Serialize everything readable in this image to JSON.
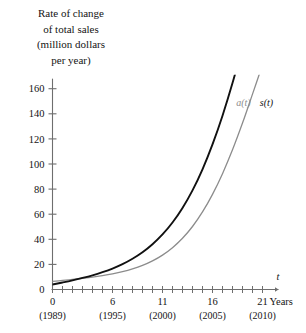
{
  "chart_data": {
    "type": "line",
    "title": "Rate of change of total sales (million dollars per year)",
    "title_lines": [
      "Rate of change",
      "of total sales",
      "(million dollars",
      "per year)"
    ],
    "xlabel_symbol": "t",
    "xlabel_unit": "Years",
    "ylabel": "Rate of change of total sales (million dollars per year)",
    "xlim": [
      0,
      22
    ],
    "ylim": [
      0,
      168
    ],
    "grid": false,
    "legend_position": "inline-at-curve-ends",
    "x_ticks_major": [
      0,
      6,
      11,
      16,
      21
    ],
    "x_tick_labels": [
      "0",
      "6",
      "11",
      "16",
      "21"
    ],
    "x_tick_sublabels": [
      "(1989)",
      "(1995)",
      "(2000)",
      "(2005)",
      "(2010)"
    ],
    "x_ticks_minor_step": 1,
    "y_ticks": [
      0,
      20,
      40,
      60,
      80,
      100,
      120,
      140,
      160
    ],
    "y_tick_labels": [
      "0",
      "20",
      "40",
      "60",
      "80",
      "100",
      "120",
      "140",
      "160"
    ],
    "series": [
      {
        "name": "a(t)",
        "label": "a(t)",
        "color": "#8c8c8c",
        "width": 1.3,
        "x": [
          0,
          1,
          2,
          3,
          4,
          5,
          6,
          7,
          8,
          9,
          10,
          11,
          12,
          13,
          14,
          15,
          16,
          17,
          18,
          19,
          20,
          21
        ],
        "values": [
          6.5,
          7.2,
          8.0,
          8.9,
          9.9,
          11.1,
          12.5,
          14.2,
          16.4,
          19.2,
          22.8,
          27.4,
          33.3,
          40.8,
          50.2,
          61.8,
          75.8,
          92.3,
          111.3,
          132.6,
          155.7,
          179.0
        ]
      },
      {
        "name": "s(t)",
        "label": "s(t)",
        "color": "#111111",
        "width": 1.9,
        "x": [
          0,
          1,
          2,
          3,
          4,
          5,
          6,
          7,
          8,
          9,
          10,
          11,
          12,
          13,
          14,
          15,
          16,
          17,
          18,
          19,
          20,
          21
        ],
        "values": [
          4.0,
          5.6,
          7.3,
          9.2,
          11.3,
          13.8,
          16.7,
          20.2,
          24.5,
          29.7,
          36.1,
          43.9,
          53.4,
          65.0,
          79.0,
          95.8,
          115.6,
          138.5,
          164.5,
          193.3,
          224.0,
          255.0
        ]
      }
    ],
    "curve_labels": [
      {
        "text": "a(t)",
        "color": "#8c8c8c",
        "x": 19.1,
        "y": 146
      },
      {
        "text": "s(t)",
        "color": "#111111",
        "x": 21.4,
        "y": 146
      }
    ],
    "axis_color": "#6e6e6e",
    "text_color": "#141414"
  }
}
